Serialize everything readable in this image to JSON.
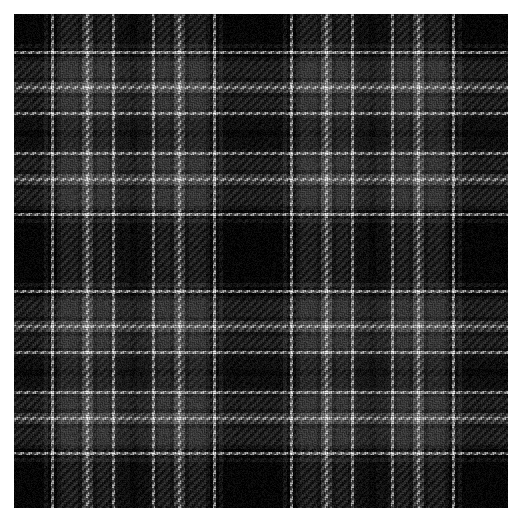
{
  "page": {
    "background_color": "#ffffff",
    "width": 523,
    "height": 519
  },
  "swatch": {
    "name": "black-grey-white-tartan",
    "x": 14,
    "y": 14,
    "width": 494,
    "height": 494,
    "symmetric": true,
    "weave": "twill-2-2",
    "thread_px": 2.0,
    "noise_amount": 26,
    "sett_repeat_px": 116,
    "palette": {
      "black": "#050505",
      "near_black": "#0c0c0c",
      "dark_charcoal": "#1a1a1a",
      "charcoal": "#242424",
      "mid_grey": "#3a3a3a",
      "light_grey": "#6e6e6e",
      "pale_grey": "#9a9a9a",
      "white": "#d8d8d8"
    },
    "sett_threadcount": [
      {
        "color": "black",
        "px": 30
      },
      {
        "color": "charcoal",
        "px": 4
      },
      {
        "color": "black",
        "px": 3
      },
      {
        "color": "white",
        "px": 3
      },
      {
        "color": "black",
        "px": 3
      },
      {
        "color": "charcoal",
        "px": 4
      },
      {
        "color": "mid_grey",
        "px": 17
      },
      {
        "color": "charcoal",
        "px": 4
      },
      {
        "color": "light_grey",
        "px": 4
      },
      {
        "color": "white",
        "px": 3
      },
      {
        "color": "light_grey",
        "px": 4
      },
      {
        "color": "charcoal",
        "px": 4
      },
      {
        "color": "mid_grey",
        "px": 12
      },
      {
        "color": "charcoal",
        "px": 3
      },
      {
        "color": "white",
        "px": 3
      },
      {
        "color": "charcoal",
        "px": 3
      },
      {
        "color": "dark_charcoal",
        "px": 12
      },
      {
        "color": "near_black",
        "px": 4
      }
    ]
  }
}
